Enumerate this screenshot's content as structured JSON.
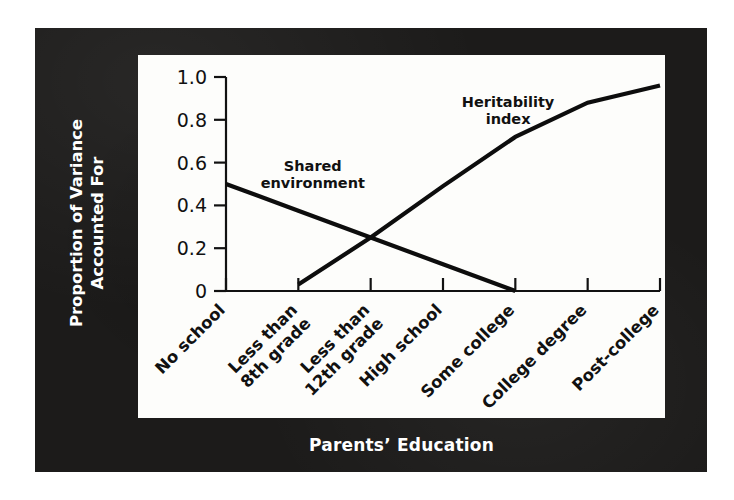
{
  "figure": {
    "y_axis_title_line1": "Proportion of Variance",
    "y_axis_title_line2": "Accounted For",
    "x_axis_title": "Parents’ Education",
    "frame_color": "#1c1b1a",
    "panel_color": "#fdfdfb",
    "ink_color": "#111111"
  },
  "chart_data": {
    "type": "line",
    "title": "",
    "xlabel": "Parents’ Education",
    "ylabel": "Proportion of Variance Accounted For",
    "categories": [
      "No school",
      "Less than 8th grade",
      "Less than 12th grade",
      "High school",
      "Some college",
      "College degree",
      "Post-college"
    ],
    "category_lines": [
      [
        "No school"
      ],
      [
        "Less than",
        "8th grade"
      ],
      [
        "Less than",
        "12th grade"
      ],
      [
        "High school"
      ],
      [
        "Some college"
      ],
      [
        "College degree"
      ],
      [
        "Post-college"
      ]
    ],
    "ylim": [
      0,
      1.0
    ],
    "yticks": [
      0,
      0.2,
      0.4,
      0.6,
      0.8,
      1.0
    ],
    "ytick_labels": [
      "0",
      "0.2",
      "0.4",
      "0.6",
      "0.8",
      "1.0"
    ],
    "grid": false,
    "legend": "inline-annotations",
    "series": [
      {
        "name": "Shared environment",
        "label_line1": "Shared",
        "label_line2": "environment",
        "color": "#0d0d0d",
        "values": [
          0.5,
          0.375,
          0.25,
          0.125,
          0.0,
          null,
          null
        ],
        "note": "Decreases linearly from 0.50 at 'No school' to 0 at 'Some college'."
      },
      {
        "name": "Heritability index",
        "label_line1": "Heritability",
        "label_line2": "index",
        "color": "#0d0d0d",
        "values": [
          null,
          0.03,
          0.25,
          0.49,
          0.72,
          0.88,
          0.96
        ],
        "note": "Rises linearly from 0 just past 'No school' to about 0.96 at 'Post-college'."
      }
    ],
    "crossing_point": {
      "x_category": "Less than 12th grade",
      "y_value": 0.25
    },
    "annotations": [
      {
        "text": "Shared environment",
        "x_value": 1.2,
        "y_value": 0.56
      },
      {
        "text": "Heritability index",
        "x_value": 3.9,
        "y_value": 0.86
      }
    ]
  }
}
